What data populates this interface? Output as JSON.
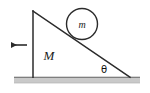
{
  "figure": {
    "type": "physics-free-body-diagram",
    "background_color": "#ffffff",
    "stroke_color": "#2b2b2b",
    "ground_fill_color": "#c9c9c9",
    "ground_edge_color": "#6e6e6e"
  },
  "labels": {
    "wedge_mass": "M",
    "ball_mass": "m",
    "incline_angle": "θ"
  },
  "shapes": {
    "wedge": {
      "name": "right-triangle-wedge",
      "apex_top": [
        33,
        11
      ],
      "bottom_left": [
        33,
        77
      ],
      "bottom_right": [
        130,
        77
      ],
      "vertical_side_label": "M"
    },
    "ball": {
      "name": "circle-ball",
      "center": [
        82,
        24
      ],
      "radius": 15.5,
      "label": "m"
    },
    "ground": {
      "name": "ground-surface",
      "x": 14,
      "y": 77,
      "width": 126,
      "height": 6
    },
    "force_arrow": {
      "name": "leftward-force-arrow",
      "direction": "left",
      "tail": [
        27,
        45
      ],
      "head": [
        9,
        45
      ]
    },
    "angle_marker": {
      "name": "theta-angle-at-base",
      "position": [
        104,
        72
      ]
    }
  }
}
